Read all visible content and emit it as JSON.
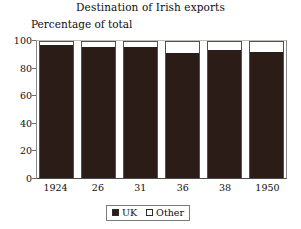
{
  "chart_data": {
    "type": "bar",
    "title": "Destination of Irish exports",
    "subtitle": "Percentage of total",
    "xlabel": "",
    "ylabel": "Percentage of total",
    "ylim": [
      0,
      100
    ],
    "ytick_labels": [
      "100",
      "80",
      "60",
      "40",
      "20",
      "0"
    ],
    "ytick_values": [
      100,
      80,
      60,
      40,
      20,
      0
    ],
    "grid": false,
    "stacked": true,
    "legend_position": "bottom",
    "categories": [
      "1924",
      "26",
      "31",
      "36",
      "38",
      "1950"
    ],
    "series": [
      {
        "name": "UK",
        "color": "#2b1c18",
        "values": [
          98,
          96,
          96,
          92,
          94,
          93
        ]
      },
      {
        "name": "Other",
        "color": "#ffffff",
        "values": [
          2,
          4,
          4,
          8,
          6,
          7
        ]
      }
    ]
  },
  "legend": {
    "entries": [
      {
        "label": "UK",
        "swatch": "filled-square-icon"
      },
      {
        "label": "Other",
        "swatch": "open-square-icon"
      }
    ]
  }
}
